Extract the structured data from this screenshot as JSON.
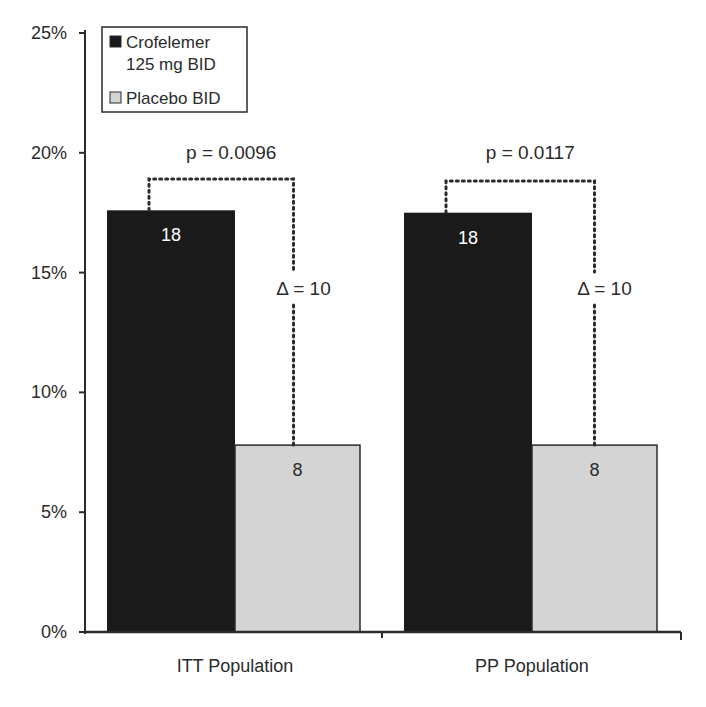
{
  "chart_data": {
    "type": "bar",
    "title": "",
    "xlabel": "",
    "ylabel": "",
    "ylim": [
      0,
      25
    ],
    "yticks": [
      "0%",
      "5%",
      "10%",
      "15%",
      "20%",
      "25%"
    ],
    "grid": false,
    "legend_position": "top-left (inside)",
    "categories": [
      "ITT Population",
      "PP Population"
    ],
    "series": [
      {
        "name": "Crofelemer 125 mg BID",
        "color": "#1a1a1a",
        "values": [
          17.6,
          17.5
        ],
        "labels": [
          "18",
          "18"
        ]
      },
      {
        "name": "Placebo BID",
        "color": "#d4d4d4",
        "values": [
          7.8,
          7.8
        ],
        "labels": [
          "8",
          "8"
        ]
      }
    ],
    "annotations": [
      {
        "category": "ITT Population",
        "p_value": "p = 0.0096",
        "delta": "Δ = 10"
      },
      {
        "category": "PP Population",
        "p_value": "p = 0.0117",
        "delta": "Δ = 10"
      }
    ]
  },
  "legend": {
    "items": [
      {
        "line1": "Crofelemer",
        "line2": "125 mg BID",
        "color": "#1a1a1a"
      },
      {
        "line1": "Placebo BID",
        "line2": "",
        "color": "#d4d4d4"
      }
    ]
  }
}
